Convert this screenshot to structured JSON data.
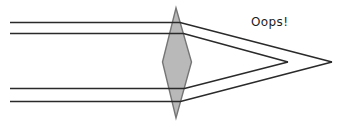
{
  "diagram": {
    "width": 338,
    "height": 124,
    "background": "#ffffff",
    "ray_color": "#2a2a2a",
    "ray_width": 1.7,
    "lens": {
      "shape": "biconvex-lens-diamond",
      "fill": "#b9b9b9",
      "border_color": "#757575",
      "border_width": 1.4,
      "vertices": [
        [
          176,
          8
        ],
        [
          191.5,
          62
        ],
        [
          176,
          118
        ],
        [
          162.5,
          62
        ]
      ]
    },
    "rays": [
      {
        "name": "top-outer-ray",
        "focus": "far",
        "points": [
          [
            10,
            22.5
          ],
          [
            180,
            22.5
          ],
          [
            332,
            62
          ]
        ]
      },
      {
        "name": "top-inner-ray",
        "focus": "near",
        "points": [
          [
            10,
            33.5
          ],
          [
            183.5,
            33.5
          ],
          [
            288,
            62
          ]
        ]
      },
      {
        "name": "bottom-inner-ray",
        "focus": "near",
        "points": [
          [
            10,
            88.5
          ],
          [
            184.5,
            88.5
          ],
          [
            288,
            62
          ]
        ]
      },
      {
        "name": "bottom-outer-ray",
        "focus": "far",
        "points": [
          [
            10,
            101.5
          ],
          [
            180.5,
            101.5
          ],
          [
            332,
            62
          ]
        ]
      }
    ],
    "focal_points": {
      "near": [
        288,
        62
      ],
      "far": [
        332,
        62
      ]
    },
    "label": {
      "text": "Oops!",
      "x": 251,
      "y": 15,
      "color": "#1c1c1c",
      "font_size": 12
    }
  }
}
